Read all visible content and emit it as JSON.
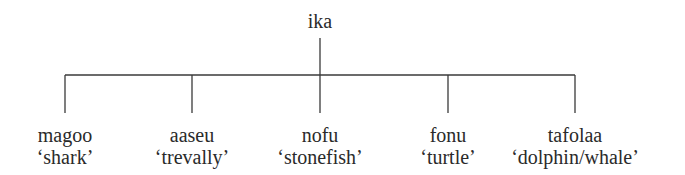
{
  "diagram": {
    "type": "tree",
    "root": {
      "label": "ika",
      "x": 320
    },
    "children": [
      {
        "word": "magoo",
        "gloss": "‘shark’",
        "x": 65
      },
      {
        "word": "aaseu",
        "gloss": "‘trevally’",
        "x": 192
      },
      {
        "word": "nofu",
        "gloss": "‘stonefish’",
        "x": 320
      },
      {
        "word": "fonu",
        "gloss": "‘turtle’",
        "x": 448
      },
      {
        "word": "tafolaa",
        "gloss": "‘dolphin/whale’",
        "x": 575
      }
    ],
    "line_color": "#3a3a3a"
  }
}
